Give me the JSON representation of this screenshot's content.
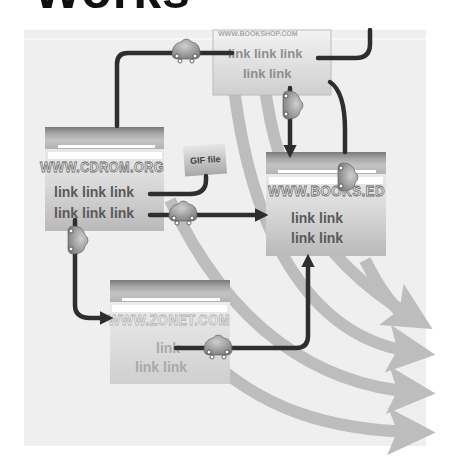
{
  "title": "Works",
  "pages": {
    "top": {
      "url": "WWW.BOOKSHOP.COM",
      "lines": [
        "link link link",
        "link link"
      ]
    },
    "cdrom": {
      "url": "WWW.CDROM.ORG",
      "lines": [
        "link link link",
        "link link link"
      ]
    },
    "books": {
      "url": "WWW.BOOKS.ED",
      "lines": [
        "link link",
        "link link"
      ]
    },
    "zonet": {
      "url": "WWW.ZONET.COM",
      "lines": [
        "link",
        "link link"
      ]
    }
  },
  "gif_box": {
    "label": "GIF file"
  },
  "colors": {
    "panel": "#eeeeee",
    "link_line": "#2e2e2e",
    "flow_arrow": "#bdbdbd",
    "page_header": "#8a8a8a"
  }
}
